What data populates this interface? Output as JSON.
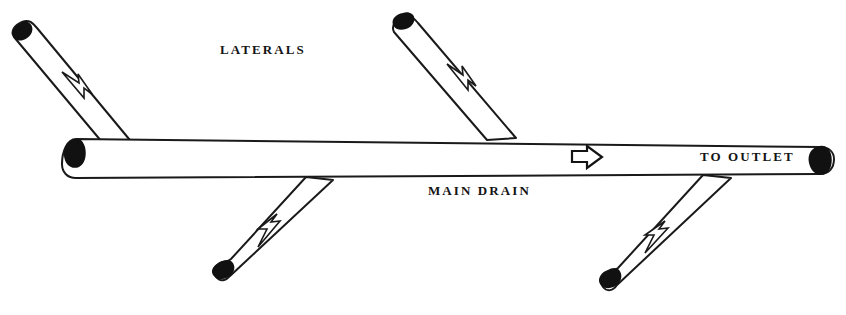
{
  "diagram": {
    "background_color": "#ffffff",
    "ink_color": "#141414",
    "labels": {
      "laterals": "LATERALS",
      "main_drain": "MAIN DRAIN",
      "to_outlet": "TO OUTLET"
    },
    "main_drain": {
      "name": "main-drain-pipe",
      "flow_direction": "right",
      "flow_arrow_glyph": "block-arrow-right"
    },
    "laterals": [
      {
        "name": "lateral-top-left",
        "position": "top-left",
        "flow_direction": "down-right",
        "arrow_glyph": "outline-arrow",
        "joins": "main-drain-top-edge"
      },
      {
        "name": "lateral-top-right",
        "position": "top-right",
        "flow_direction": "down-right",
        "arrow_glyph": "outline-arrow",
        "joins": "main-drain-top-edge"
      },
      {
        "name": "lateral-bottom-left",
        "position": "bottom-left",
        "flow_direction": "up-right",
        "arrow_glyph": "outline-arrow",
        "joins": "main-drain-bottom-edge"
      },
      {
        "name": "lateral-bottom-right",
        "position": "bottom-right",
        "flow_direction": "up-right",
        "arrow_glyph": "outline-arrow",
        "joins": "main-drain-bottom-edge"
      }
    ]
  }
}
